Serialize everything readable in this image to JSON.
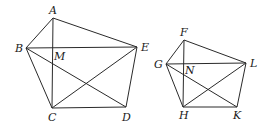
{
  "figure": {
    "pentagon_1": {
      "vertices": {
        "A": [
          53,
          18
        ],
        "B": [
          26,
          48
        ],
        "C": [
          52,
          108
        ],
        "D": [
          126,
          107
        ],
        "E": [
          137,
          47
        ]
      },
      "labels": {
        "A": {
          "text": "A",
          "pos": [
            49,
            14
          ]
        },
        "B": {
          "text": "B",
          "pos": [
            15,
            52
          ]
        },
        "M": {
          "text": "M",
          "pos": [
            54,
            60
          ]
        },
        "E": {
          "text": "E",
          "pos": [
            141,
            51
          ]
        },
        "C": {
          "text": "C",
          "pos": [
            48,
            121
          ]
        },
        "D": {
          "text": "D",
          "pos": [
            122,
            121
          ]
        }
      },
      "sides": [
        [
          "A",
          "B"
        ],
        [
          "B",
          "C"
        ],
        [
          "C",
          "D"
        ],
        [
          "D",
          "E"
        ],
        [
          "E",
          "A"
        ]
      ],
      "diagonals": [
        [
          "A",
          "C"
        ],
        [
          "B",
          "E"
        ],
        [
          "B",
          "D"
        ],
        [
          "C",
          "E"
        ]
      ]
    },
    "pentagon_2": {
      "vertices": {
        "F": [
          184,
          40
        ],
        "G": [
          166,
          64
        ],
        "H": [
          183,
          107
        ],
        "K": [
          237,
          107
        ],
        "L": [
          246,
          63
        ]
      },
      "labels": {
        "F": {
          "text": "F",
          "pos": [
            180,
            36
          ]
        },
        "G": {
          "text": "G",
          "pos": [
            154,
            68
          ]
        },
        "N": {
          "text": "N",
          "pos": [
            185,
            74
          ]
        },
        "L": {
          "text": "L",
          "pos": [
            250,
            67
          ]
        },
        "H": {
          "text": "H",
          "pos": [
            179,
            119
          ]
        },
        "K": {
          "text": "K",
          "pos": [
            233,
            119
          ]
        }
      },
      "sides": [
        [
          "F",
          "G"
        ],
        [
          "G",
          "H"
        ],
        [
          "H",
          "K"
        ],
        [
          "K",
          "L"
        ],
        [
          "L",
          "F"
        ]
      ],
      "diagonals": [
        [
          "F",
          "H"
        ],
        [
          "G",
          "L"
        ],
        [
          "G",
          "K"
        ],
        [
          "H",
          "L"
        ]
      ]
    }
  }
}
